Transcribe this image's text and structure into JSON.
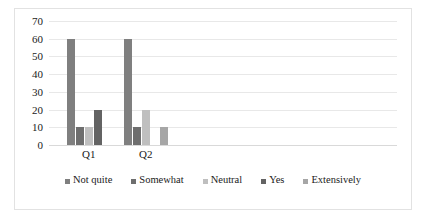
{
  "chart_data": {
    "type": "bar",
    "title": "",
    "subtitle": "",
    "xlabel": "",
    "ylabel": "",
    "categories": [
      "Q1",
      "Q2"
    ],
    "series": [
      {
        "name": "Not quite",
        "values": [
          60,
          60
        ],
        "color": "#7f7f7f"
      },
      {
        "name": "Somewhat",
        "values": [
          10,
          10
        ],
        "color": "#6e6e6e"
      },
      {
        "name": "Neutral",
        "values": [
          10,
          20
        ],
        "color": "#bfbfbf"
      },
      {
        "name": "Yes",
        "values": [
          20,
          0
        ],
        "color": "#636363"
      },
      {
        "name": "Extensively",
        "values": [
          0,
          10
        ],
        "color": "#a6a6a6"
      }
    ],
    "ylim": [
      0,
      70
    ],
    "yticks": [
      0,
      10,
      20,
      30,
      40,
      50,
      60,
      70
    ],
    "ytick_labels": [
      "0",
      "10",
      "20",
      "30",
      "40",
      "50",
      "60",
      "70"
    ],
    "grid": true,
    "grid_axis": "y",
    "legend_position": "bottom",
    "gridline_color": "#e8e8e8",
    "axis_color": "#d9d9d9",
    "border_color": "#e2e2e2",
    "background_color": "#ffffff",
    "text_color": "#1a1a1a"
  }
}
